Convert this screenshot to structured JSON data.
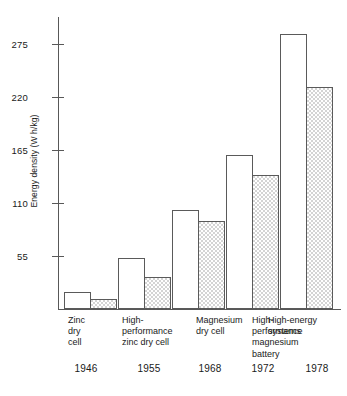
{
  "chart_data": {
    "type": "bar",
    "title": "",
    "xlabel": "",
    "ylabel": "Energy density (W h/kg)",
    "ylim": [
      0,
      292
    ],
    "grid": false,
    "legend": "none",
    "yticks": [
      55,
      110,
      165,
      220,
      275
    ],
    "ytick_labels": [
      "55",
      "110",
      "165",
      "220",
      "275"
    ],
    "categories": [
      "Zinc dry cell",
      "High-performance zinc dry cell",
      "Magnesium dry cell",
      "High-performance magnesium battery",
      "High-energy systems"
    ],
    "category_lines": [
      [
        "Zinc",
        "dry",
        "cell"
      ],
      [
        "High-",
        "performance",
        "zinc dry cell"
      ],
      [
        "Magnesium",
        "dry cell"
      ],
      [
        "High-",
        "performance",
        "magnesium",
        "battery"
      ],
      [
        "High-energy",
        "systems"
      ]
    ],
    "x": [
      "1946",
      "1955",
      "1968",
      "1972",
      "1978"
    ],
    "series": [
      {
        "name": "open",
        "values": [
          17,
          51,
          99,
          154,
          275
        ]
      },
      {
        "name": "shaded",
        "values": [
          10,
          32,
          88,
          134,
          222
        ]
      }
    ]
  },
  "style": {
    "axis_color": "#585858",
    "bar_border": "#5a5a5a",
    "open_fill": "#ffffff",
    "shaded_fill": "#d4d4d4",
    "text_color": "#1a1a1a",
    "background": "#ffffff"
  }
}
